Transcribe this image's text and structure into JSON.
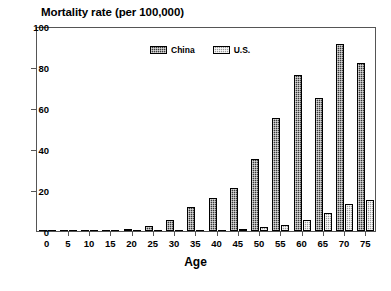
{
  "chart_data": {
    "type": "bar",
    "title": "Mortality rate (per 100,000)",
    "xlabel": "Age",
    "ylabel": "",
    "categories": [
      "0",
      "5",
      "10",
      "15",
      "20",
      "25",
      "30",
      "35",
      "40",
      "45",
      "50",
      "55",
      "60",
      "65",
      "70",
      "75"
    ],
    "series": [
      {
        "name": "China",
        "values": [
          0.2,
          0.2,
          0.3,
          0.4,
          0.8,
          2.6,
          5.3,
          11.5,
          16.0,
          21.0,
          35.0,
          55.0,
          76.0,
          65.0,
          91.0,
          82.0
        ]
      },
      {
        "name": "U.S.",
        "values": [
          0.0,
          0.0,
          0.0,
          0.0,
          0.1,
          0.2,
          0.3,
          0.4,
          0.5,
          1.0,
          2.0,
          3.0,
          5.5,
          9.0,
          13.0,
          15.0
        ]
      }
    ],
    "xlim": [
      0,
      75
    ],
    "ylim": [
      0,
      100
    ],
    "yticks": [
      "0",
      "20",
      "40",
      "60",
      "80",
      "100"
    ],
    "grid": false,
    "legend_position": "top-center",
    "colors": {
      "china": "#3a3a3a",
      "us": "#9a9a9a",
      "axis": "#555555",
      "text": "#000000",
      "background": "#ffffff"
    }
  }
}
